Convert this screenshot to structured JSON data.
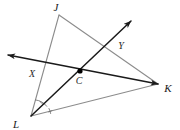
{
  "figure": {
    "type": "geometry-diagram",
    "width": 180,
    "height": 130,
    "background_color": "#ffffff",
    "triangle_stroke_color": "#8c8c8c",
    "ray_stroke_color": "#1a1a1a",
    "point_fill_color": "#000000",
    "label_color": "#1a1a1a"
  },
  "labels": {
    "J": "J",
    "K": "K",
    "L": "L",
    "C": "C",
    "X": "X",
    "Y": "Y"
  },
  "points": {
    "J": {
      "x": 59,
      "y": 15,
      "label": "J",
      "label_x": 56,
      "label_y": 10
    },
    "K": {
      "x": 158,
      "y": 84,
      "label": "K",
      "label_x": 166,
      "label_y": 91
    },
    "L": {
      "x": 31,
      "y": 116,
      "label": "L",
      "label_x": 14,
      "label_y": 127
    },
    "C": {
      "x": 80,
      "y": 71,
      "label": "C",
      "label_x": 76,
      "label_y": 83
    },
    "X": {
      "x": 39,
      "y": 64,
      "label": "X",
      "label_x": 29,
      "label_y": 76
    },
    "Y": {
      "x": 113,
      "y": 41,
      "label": "Y",
      "label_x": 117,
      "label_y": 48
    }
  },
  "segments": [
    {
      "name": "side-JK",
      "from": "J",
      "to": "K",
      "style": "triangle-side"
    },
    {
      "name": "side-KL",
      "from": "K",
      "to": "L",
      "style": "triangle-side"
    },
    {
      "name": "side-LJ",
      "from": "L",
      "to": "J",
      "style": "triangle-side"
    }
  ],
  "rays": [
    {
      "name": "ray-through-X-C-to-K",
      "description": "ray with arrowhead at far left passing through X and C and arriving at K",
      "tail_x": 8,
      "tail_y": 55,
      "head_x": 158,
      "head_y": 84,
      "arrow_at_tail": true,
      "arrow_at_head": true
    },
    {
      "name": "ray-L-through-C-through-Y",
      "description": "ray from vertex L through C and Y with arrowhead in upper right",
      "tail_x": 31,
      "tail_y": 116,
      "head_x": 131,
      "head_y": 21,
      "arrow_at_tail": false,
      "arrow_at_head": true
    }
  ],
  "angle_marks": {
    "vertex": "L",
    "count": 2,
    "description": "two congruent angle arcs with single tick marks at vertex L"
  }
}
